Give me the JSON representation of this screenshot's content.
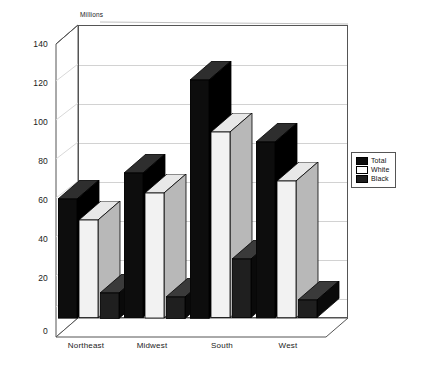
{
  "chart_data": {
    "type": "bar",
    "title": "",
    "subtitle": "",
    "unit_label": "Millions",
    "xlabel": "",
    "ylabel": "Millions",
    "categories": [
      "Northeast",
      "Midwest",
      "South",
      "West"
    ],
    "series": [
      {
        "name": "Total",
        "color": "#0d0d0d",
        "values": [
          61,
          74,
          122,
          90
        ]
      },
      {
        "name": "White",
        "color": "#f2f2f2",
        "values": [
          50,
          64,
          95,
          70
        ]
      },
      {
        "name": "Black",
        "color": "#1f1f1f",
        "values": [
          13,
          11,
          30,
          9
        ]
      }
    ],
    "ylim": [
      0,
      150
    ],
    "yticks": [
      0,
      20,
      40,
      60,
      80,
      100,
      120,
      140
    ],
    "ytick_labels": [
      "0",
      "20",
      "40",
      "60",
      "80",
      "100",
      "120",
      "140"
    ],
    "grid": true,
    "grid_axis": "y",
    "legend_position": "right",
    "three_d": true
  },
  "legend": {
    "entries": [
      {
        "label": "Total"
      },
      {
        "label": "White"
      },
      {
        "label": "Black"
      }
    ]
  },
  "colors": {
    "total": "#0d0d0d",
    "white": "#f2f2f2",
    "black": "#1f1f1f",
    "gridline": "#d2d2d2",
    "axis": "#555555",
    "background": "#ffffff"
  }
}
